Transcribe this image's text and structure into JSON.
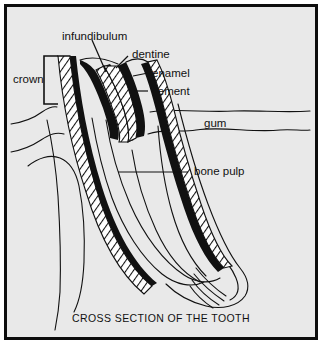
{
  "figure": {
    "caption": "CROSS SECTION OF THE TOOTH",
    "background_color": "#e9e9e9",
    "border_color": "#0d0d0d",
    "ink_color": "#111111",
    "labels": {
      "infundibulum": "infundibulum",
      "dentine": "dentine",
      "enamel": "enamel",
      "cement": "cement",
      "crown": "crown",
      "gum": "gum",
      "bone_pulp": "bone pulp"
    }
  }
}
